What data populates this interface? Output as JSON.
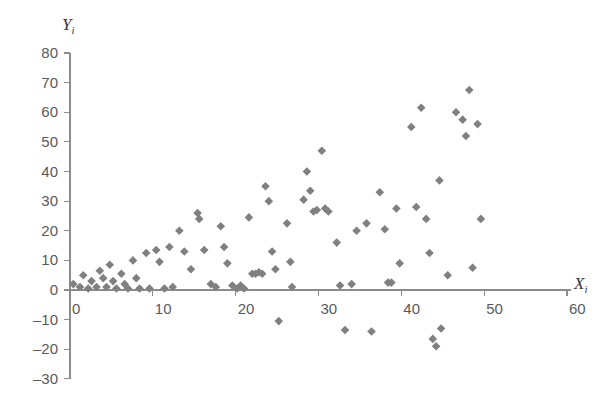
{
  "chart_data": {
    "type": "scatter",
    "title": "",
    "subtitle": "",
    "xlabel": "X",
    "xlabel_subscript": "i",
    "ylabel": "Y",
    "ylabel_subscript": "i",
    "xlim": [
      0,
      60
    ],
    "ylim": [
      -30,
      80
    ],
    "xticks": [
      0,
      10,
      20,
      30,
      40,
      50,
      60
    ],
    "yticks": [
      -30,
      -20,
      -10,
      0,
      10,
      20,
      30,
      40,
      50,
      60,
      70,
      80
    ],
    "xtick_labels": [
      "0",
      "10",
      "20",
      "30",
      "40",
      "50",
      "60"
    ],
    "ytick_labels": [
      "-30",
      "-20",
      "-10",
      "0",
      "10",
      "20",
      "30",
      "40",
      "50",
      "60",
      "70",
      "80"
    ],
    "grid": false,
    "legend": false,
    "legend_position": "none",
    "marker": "diamond",
    "marker_color": "#808080",
    "marker_size": 7,
    "axis_color": "#8c8c8e",
    "background_color": "#ffffff",
    "series": [
      {
        "name": "observations",
        "points": [
          [
            0.4,
            2.0
          ],
          [
            1.2,
            1.0
          ],
          [
            1.6,
            5.0
          ],
          [
            2.2,
            0.5
          ],
          [
            2.6,
            3.0
          ],
          [
            3.2,
            1.0
          ],
          [
            3.6,
            6.5
          ],
          [
            4.0,
            4.0
          ],
          [
            4.4,
            1.0
          ],
          [
            4.8,
            8.5
          ],
          [
            5.2,
            3.0
          ],
          [
            5.6,
            0.5
          ],
          [
            6.2,
            5.5
          ],
          [
            6.6,
            2.0
          ],
          [
            7.0,
            0.5
          ],
          [
            7.6,
            10.0
          ],
          [
            8.0,
            4.0
          ],
          [
            8.4,
            0.5
          ],
          [
            9.2,
            12.5
          ],
          [
            9.6,
            0.5
          ],
          [
            10.4,
            13.5
          ],
          [
            10.8,
            9.5
          ],
          [
            11.4,
            0.5
          ],
          [
            12.0,
            14.5
          ],
          [
            12.4,
            1.0
          ],
          [
            13.2,
            20.0
          ],
          [
            13.8,
            13.0
          ],
          [
            14.6,
            7.0
          ],
          [
            15.4,
            26.0
          ],
          [
            15.6,
            24.0
          ],
          [
            16.2,
            13.5
          ],
          [
            17.0,
            2.0
          ],
          [
            17.6,
            1.0
          ],
          [
            18.2,
            21.5
          ],
          [
            18.6,
            14.5
          ],
          [
            19.0,
            9.0
          ],
          [
            19.6,
            1.5
          ],
          [
            20.2,
            0.5
          ],
          [
            20.6,
            1.5
          ],
          [
            21.0,
            0.5
          ],
          [
            21.6,
            24.5
          ],
          [
            22.0,
            5.5
          ],
          [
            22.4,
            5.5
          ],
          [
            22.8,
            6.0
          ],
          [
            23.2,
            5.5
          ],
          [
            23.6,
            35.0
          ],
          [
            24.0,
            30.0
          ],
          [
            24.4,
            13.0
          ],
          [
            24.8,
            7.0
          ],
          [
            25.2,
            -10.5
          ],
          [
            26.2,
            22.5
          ],
          [
            26.6,
            9.5
          ],
          [
            26.8,
            1.0
          ],
          [
            28.2,
            30.5
          ],
          [
            28.6,
            40.0
          ],
          [
            29.0,
            33.5
          ],
          [
            29.4,
            26.5
          ],
          [
            29.8,
            27.0
          ],
          [
            30.4,
            47.0
          ],
          [
            30.8,
            27.5
          ],
          [
            31.2,
            26.5
          ],
          [
            32.2,
            16.0
          ],
          [
            32.6,
            1.5
          ],
          [
            33.2,
            -13.5
          ],
          [
            34.0,
            2.0
          ],
          [
            34.6,
            20.0
          ],
          [
            35.8,
            22.5
          ],
          [
            36.4,
            -14.0
          ],
          [
            37.4,
            33.0
          ],
          [
            38.0,
            20.5
          ],
          [
            38.4,
            2.5
          ],
          [
            38.8,
            2.5
          ],
          [
            39.4,
            27.5
          ],
          [
            39.8,
            9.0
          ],
          [
            41.2,
            55.0
          ],
          [
            41.8,
            28.0
          ],
          [
            42.4,
            61.5
          ],
          [
            43.0,
            24.0
          ],
          [
            43.4,
            12.5
          ],
          [
            43.8,
            -16.5
          ],
          [
            44.2,
            -19.0
          ],
          [
            44.6,
            37.0
          ],
          [
            44.8,
            -13.0
          ],
          [
            45.6,
            5.0
          ],
          [
            46.6,
            60.0
          ],
          [
            47.4,
            57.5
          ],
          [
            47.8,
            52.0
          ],
          [
            48.2,
            67.5
          ],
          [
            48.6,
            7.5
          ],
          [
            49.2,
            56.0
          ],
          [
            49.6,
            24.0
          ]
        ]
      }
    ]
  },
  "axis_titles": {
    "x": "X",
    "x_sub": "i",
    "y": "Y",
    "y_sub": "i"
  }
}
